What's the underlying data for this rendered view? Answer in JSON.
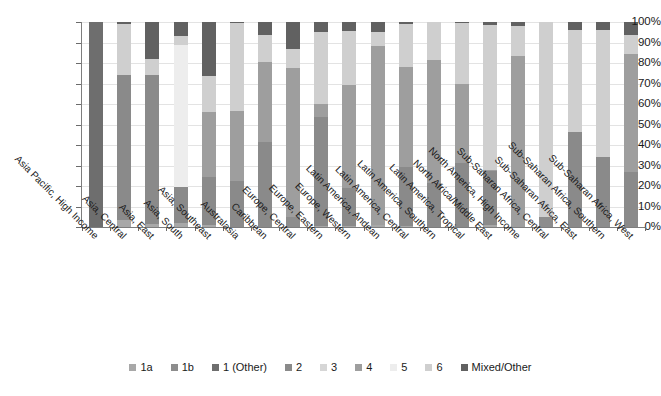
{
  "chart_data": {
    "type": "bar",
    "title": "",
    "subtitle": "",
    "xlabel": "",
    "ylabel": "",
    "stacked": true,
    "stack_mode": "percent",
    "ylim": [
      0,
      100
    ],
    "grid": true,
    "legend_position": "bottom",
    "ytick_labels": [
      "100%",
      "90%",
      "80%",
      "70%",
      "60%",
      "50%",
      "40%",
      "30%",
      "20%",
      "10%",
      "0%"
    ],
    "ytick_values": [
      100,
      90,
      80,
      70,
      60,
      50,
      40,
      30,
      20,
      10,
      0
    ],
    "categories": [
      "Asia Pacific, High Income",
      "Asia, Central",
      "Asia, East",
      "Asia, South",
      "Asia, Southeast",
      "Australasia",
      "Caribbean",
      "Europe, Central",
      "Europe, Eastern",
      "Europe, Western",
      "Latin America, Andean",
      "Latin America, Central",
      "Latin America, Southern",
      "Latin America, Tropical",
      "North Africa/Middle East",
      "North America, High Income",
      "Sub-Saharan Africa, Central",
      "Sub-Saharan Africa, East",
      "Sub-Saharan Africa, Southern",
      "Sub-Saharan Africa, West"
    ],
    "series": [
      {
        "name": "1a",
        "color": "#a8a8a8",
        "values": [
          0,
          3.5,
          1.5,
          2.0,
          1.0,
          0.0,
          0.0,
          0.0,
          0.5,
          0.5,
          0.8,
          0.5,
          0.0,
          0.0,
          1.0,
          0.0,
          0.0,
          0.0,
          0.0,
          0.0
        ]
      },
      {
        "name": "1b",
        "color": "#8d8d8d",
        "values": [
          0,
          0.0,
          0.0,
          0.0,
          0.0,
          0.0,
          0.0,
          5.0,
          0.0,
          0.0,
          0.0,
          0.0,
          0.0,
          0.0,
          0.0,
          0.0,
          5.0,
          0.0,
          3.5,
          0.0
        ]
      },
      {
        "name": "1 (Other)",
        "color": "#6e6e6e",
        "values": [
          100,
          0.0,
          0.0,
          0.0,
          0.0,
          0.0,
          0.0,
          0.0,
          0.0,
          0.0,
          0.0,
          0.0,
          0.0,
          0.0,
          0.0,
          0.0,
          0.0,
          0.0,
          0.0,
          0.0
        ]
      },
      {
        "name": "2",
        "color": "#8a8a8a",
        "values": [
          0,
          70.5,
          72.5,
          17.5,
          23.5,
          22.5,
          41.5,
          0.0,
          53.0,
          18.5,
          0.0,
          29.0,
          21.5,
          31.0,
          26.5,
          0.0,
          0.0,
          46.5,
          30.5,
          27.0
        ]
      },
      {
        "name": "3",
        "color": "#d6d6d6",
        "values": [
          0,
          0.0,
          0.0,
          0.0,
          0.0,
          0.0,
          0.0,
          0.0,
          0.0,
          0.0,
          0.0,
          0.0,
          0.0,
          0.0,
          0.0,
          0.0,
          0.0,
          0.0,
          0.0,
          0.0
        ]
      },
      {
        "name": "4",
        "color": "#9e9e9e",
        "values": [
          0,
          0.0,
          0.0,
          0.0,
          31.5,
          34.0,
          39.0,
          72.5,
          6.5,
          50.5,
          87.5,
          48.5,
          60.0,
          39.0,
          0.5,
          83.5,
          0.0,
          0.0,
          0.0,
          57.5
        ]
      },
      {
        "name": "5",
        "color": "#ededed",
        "values": [
          0,
          0.0,
          0.0,
          69.5,
          0.0,
          0.0,
          0.0,
          0.0,
          0.0,
          0.0,
          0.0,
          0.0,
          0.0,
          0.0,
          0.0,
          0.0,
          0.0,
          0.0,
          0.0,
          0.0
        ]
      },
      {
        "name": "6",
        "color": "#cfcfcf",
        "values": [
          0,
          25.0,
          8.0,
          4.0,
          17.5,
          43.0,
          13.0,
          9.5,
          35.0,
          26.0,
          7.0,
          21.0,
          18.5,
          29.5,
          70.5,
          14.5,
          95.0,
          49.5,
          62.0,
          9.0
        ]
      },
      {
        "name": "Mixed/Other",
        "color": "#616161",
        "values": [
          0,
          1.0,
          18.0,
          7.0,
          26.5,
          0.5,
          6.5,
          13.0,
          5.0,
          4.5,
          4.7,
          1.0,
          0.0,
          0.5,
          1.5,
          2.0,
          0.0,
          4.0,
          4.0,
          6.5
        ]
      }
    ]
  },
  "legend": {
    "items": [
      {
        "label": "1a",
        "color": "#a8a8a8"
      },
      {
        "label": "1b",
        "color": "#8d8d8d"
      },
      {
        "label": "1 (Other)",
        "color": "#6e6e6e"
      },
      {
        "label": "2",
        "color": "#8a8a8a"
      },
      {
        "label": "3",
        "color": "#d6d6d6"
      },
      {
        "label": "4",
        "color": "#9e9e9e"
      },
      {
        "label": "5",
        "color": "#ededed"
      },
      {
        "label": "6",
        "color": "#cfcfcf"
      },
      {
        "label": "Mixed/Other",
        "color": "#616161"
      }
    ]
  }
}
